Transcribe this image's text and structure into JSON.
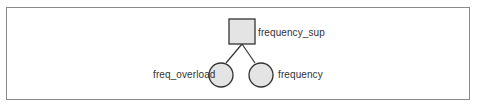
{
  "diagram": {
    "root": {
      "label": "frequency_sup",
      "shape": "square"
    },
    "children": [
      {
        "label": "freq_overload",
        "shape": "circle"
      },
      {
        "label": "frequency",
        "shape": "circle"
      }
    ],
    "colors": {
      "fill": "#e4e4e4",
      "stroke": "#333333",
      "frame": "#8a8a8a"
    }
  }
}
